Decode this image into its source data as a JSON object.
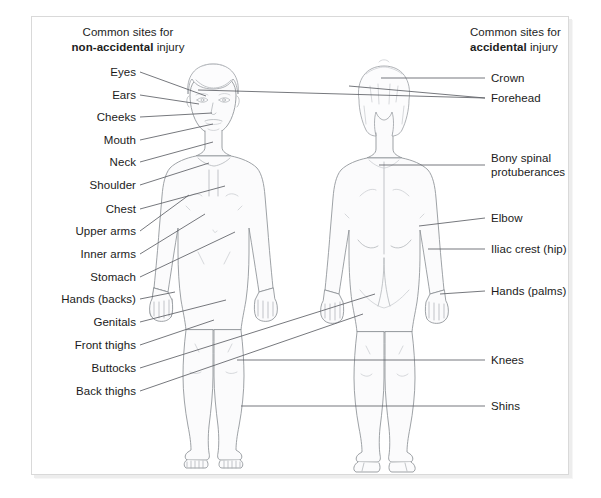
{
  "figure": {
    "title_left_line1": "Common sites for",
    "title_left_bold": "non-accidental",
    "title_left_tail": " injury",
    "title_right_line1": "Common sites for",
    "title_right_bold": "accidental",
    "title_right_tail": " injury",
    "front_figure_name": "front-view-child-body",
    "back_figure_name": "back-view-child-body"
  },
  "colors": {
    "label_text": "#1b1b1b",
    "leader_line": "#5d6065",
    "body_outline": "#8d9196",
    "body_fill": "#fbfbfc",
    "frame_border": "#d9d9d9",
    "page_background": "#ffffff"
  },
  "labels_left": [
    {
      "text": "Eyes",
      "y": 72,
      "lx": 140,
      "tx": 206,
      "ty": 96
    },
    {
      "text": "Ears",
      "y": 95,
      "lx": 140,
      "tx": 199,
      "ty": 104
    },
    {
      "text": "Cheeks",
      "y": 117,
      "lx": 140,
      "tx": 212,
      "ty": 113
    },
    {
      "text": "Mouth",
      "y": 140,
      "lx": 140,
      "tx": 213,
      "ty": 124
    },
    {
      "text": "Neck",
      "y": 162,
      "lx": 140,
      "tx": 213,
      "ty": 142
    },
    {
      "text": "Shoulder",
      "y": 185,
      "lx": 140,
      "tx": 209,
      "ty": 163
    },
    {
      "text": "Chest",
      "y": 209,
      "lx": 140,
      "tx": 225,
      "ty": 186
    },
    {
      "text": "Upper arms",
      "y": 231,
      "lx": 140,
      "tx": 189,
      "ty": 195
    },
    {
      "text": "Inner arms",
      "y": 254,
      "lx": 140,
      "tx": 205,
      "ty": 214
    },
    {
      "text": "Stomach",
      "y": 277,
      "lx": 140,
      "tx": 235,
      "ty": 232
    },
    {
      "text": "Hands (backs)",
      "y": 299,
      "lx": 140,
      "tx": 175,
      "ty": 292
    },
    {
      "text": "Genitals",
      "y": 322,
      "lx": 140,
      "tx": 226,
      "ty": 300
    },
    {
      "text": "Front thighs",
      "y": 345,
      "lx": 140,
      "tx": 214,
      "ty": 320
    },
    {
      "text": "Buttocks",
      "y": 368,
      "lx": 140,
      "tx": 375,
      "ty": 294
    },
    {
      "text": "Back thighs",
      "y": 391,
      "lx": 140,
      "tx": 363,
      "ty": 314
    }
  ],
  "labels_right": [
    {
      "text": "Crown",
      "y": 78,
      "lx": 485,
      "tx": 381,
      "ty": 78,
      "two": false
    },
    {
      "text": "Forehead",
      "y": 98,
      "lx": 485,
      "tx": 349,
      "ty": 86,
      "two": false
    },
    {
      "text": "Bony spinal",
      "text2": "protuberances",
      "y": 165,
      "lx": 485,
      "tx": 379,
      "ty": 165,
      "two": true
    },
    {
      "text": "Elbow",
      "y": 218,
      "lx": 485,
      "tx": 419,
      "ty": 226,
      "two": false
    },
    {
      "text": "Iliac crest (hip)",
      "y": 249,
      "lx": 485,
      "tx": 428,
      "ty": 249,
      "two": false
    },
    {
      "text": "Hands (palms)",
      "y": 291,
      "lx": 485,
      "tx": 440,
      "ty": 294,
      "two": false
    },
    {
      "text": "Knees",
      "y": 360,
      "lx": 485,
      "tx": 237,
      "ty": 360,
      "two": false
    },
    {
      "text": "Shins",
      "y": 406,
      "lx": 485,
      "tx": 241,
      "ty": 406,
      "two": false
    }
  ],
  "extra_leaders": [
    {
      "name": "forehead-second-leader",
      "x1": 485,
      "y1": 98,
      "x2": 198,
      "y2": 90
    }
  ]
}
